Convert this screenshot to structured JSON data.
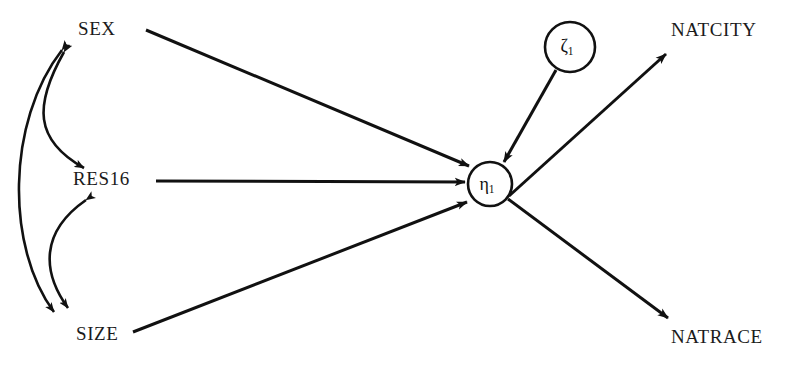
{
  "diagram": {
    "type": "path-diagram",
    "background_color": "#ffffff",
    "stroke_color": "#111111",
    "observed_variables": [
      {
        "id": "sex",
        "label": "SEX",
        "x": 100,
        "y": 31,
        "role": "exogenous-observed"
      },
      {
        "id": "res16",
        "label": "RES16",
        "x": 110,
        "y": 181,
        "role": "exogenous-observed"
      },
      {
        "id": "size",
        "label": "SIZE",
        "x": 102,
        "y": 336,
        "role": "exogenous-observed"
      },
      {
        "id": "natcity",
        "label": "NATCITY",
        "x": 721,
        "y": 32,
        "role": "endogenous-indicator"
      },
      {
        "id": "natrace",
        "label": "NATRACE",
        "x": 723,
        "y": 339,
        "role": "endogenous-indicator"
      }
    ],
    "latent_variables": [
      {
        "id": "eta1",
        "glyph": "η",
        "subscript": "1",
        "label": "eta-1",
        "cx": 490,
        "cy": 184,
        "r": 22,
        "role": "latent-factor"
      },
      {
        "id": "zeta1",
        "glyph": "ζ",
        "subscript": "1",
        "label": "zeta-1",
        "cx": 570,
        "cy": 47,
        "r": 25,
        "role": "disturbance"
      }
    ],
    "directed_paths": [
      {
        "id": "sex-to-eta1",
        "from": "SEX",
        "to": "eta-1",
        "style": "straight"
      },
      {
        "id": "res16-to-eta1",
        "from": "RES16",
        "to": "eta-1",
        "style": "straight"
      },
      {
        "id": "size-to-eta1",
        "from": "SIZE",
        "to": "eta-1",
        "style": "straight"
      },
      {
        "id": "zeta1-to-eta1",
        "from": "zeta-1",
        "to": "eta-1",
        "style": "straight"
      },
      {
        "id": "eta1-to-natcity",
        "from": "eta-1",
        "to": "NATCITY",
        "style": "straight"
      },
      {
        "id": "eta1-to-natrace",
        "from": "eta-1",
        "to": "NATRACE",
        "style": "straight"
      }
    ],
    "covariance_paths": [
      {
        "id": "sex-res16-covariance",
        "between": [
          "SEX",
          "RES16"
        ],
        "style": "curved-double-headed"
      },
      {
        "id": "res16-size-covariance",
        "between": [
          "RES16",
          "SIZE"
        ],
        "style": "curved-double-headed"
      },
      {
        "id": "sex-size-covariance",
        "between": [
          "SEX",
          "SIZE"
        ],
        "style": "curved-double-headed"
      }
    ]
  }
}
